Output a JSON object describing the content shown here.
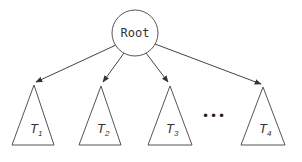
{
  "diagram": {
    "root": {
      "label": "Root"
    },
    "subtrees": [
      {
        "letter": "T",
        "sub": "1"
      },
      {
        "letter": "T",
        "sub": "2"
      },
      {
        "letter": "T",
        "sub": "3"
      },
      {
        "letter": "T",
        "sub": "4"
      }
    ],
    "ellipsis": "•••",
    "colors": {
      "stroke": "#555555",
      "text": "#333333",
      "background": "#ffffff"
    }
  }
}
